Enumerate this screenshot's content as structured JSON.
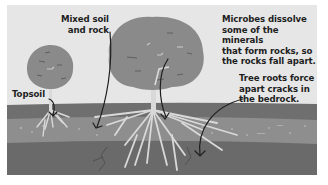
{
  "diagram": {
    "type": "soil-weathering-cross-section",
    "labels": {
      "mixed_soil": [
        "Mixed soil",
        "and rock"
      ],
      "topsoil": "Topsoil",
      "microbes": [
        "Microbes dissolve",
        "some of the minerals",
        "that form rocks, so",
        "the rocks fall apart."
      ],
      "roots": [
        "Tree roots force",
        "apart cracks in",
        "the bedrock."
      ]
    },
    "layers": [
      {
        "name": "Topsoil",
        "color": "#6f6f6f"
      },
      {
        "name": "Mixed soil and rock",
        "color": "#8e8e8e"
      },
      {
        "name": "Bedrock",
        "color": "#6a6a6a"
      }
    ],
    "colors": {
      "background": "#e6e6e6",
      "tree_canopy": "#8a8a8a",
      "trunk_roots": "#d9d9d9",
      "arrow": "#1e1e1e"
    }
  }
}
